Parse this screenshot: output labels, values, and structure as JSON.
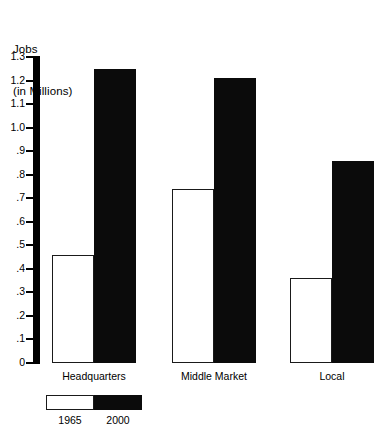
{
  "chart_data": {
    "type": "bar",
    "title": "Jobs\n(in Millions)",
    "title_lines": [
      "Jobs",
      "(in Millions)"
    ],
    "xlabel": "",
    "ylabel": "Jobs (in Millions)",
    "ylim": [
      0,
      1.3
    ],
    "grid": false,
    "legend_position": "bottom-left",
    "ytick_labels": [
      "1.3",
      "1.2",
      "1.1",
      "1.0",
      ".9",
      ".8",
      ".7",
      ".6",
      ".5",
      ".4",
      ".3",
      ".2",
      ".1",
      "0"
    ],
    "ytick_values": [
      1.3,
      1.2,
      1.1,
      1.0,
      0.9,
      0.8,
      0.7,
      0.6,
      0.5,
      0.4,
      0.3,
      0.2,
      0.1,
      0
    ],
    "categories": [
      "Headquarters",
      "Middle Market",
      "Local"
    ],
    "series": [
      {
        "name": "1965",
        "color": "#ffffff",
        "values": [
          0.46,
          0.74,
          0.36
        ]
      },
      {
        "name": "2000",
        "color": "#0b0b0b",
        "values": [
          1.25,
          1.21,
          0.86
        ]
      }
    ]
  },
  "legend": {
    "items": [
      {
        "label": "1965",
        "swatch": "white-swatch"
      },
      {
        "label": "2000",
        "swatch": "black-swatch"
      }
    ]
  }
}
